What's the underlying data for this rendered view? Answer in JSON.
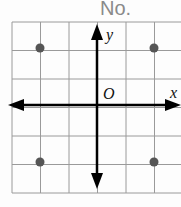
{
  "header": {
    "label": "No."
  },
  "graph": {
    "x_axis_label": "x",
    "y_axis_label": "y",
    "origin_label": "O",
    "grid": {
      "cols": 6,
      "rows": 6,
      "cell_px": 28.5
    },
    "points": [
      {
        "x": -2,
        "y": 2
      },
      {
        "x": 2,
        "y": 2
      },
      {
        "x": -2,
        "y": -2
      },
      {
        "x": 2,
        "y": -2
      }
    ],
    "colors": {
      "grid": "#9a9a9a",
      "axis": "#000000",
      "point": "#555555"
    }
  }
}
